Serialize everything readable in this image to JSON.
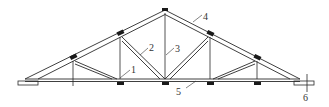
{
  "diagram": {
    "type": "roof-truss",
    "labels": [
      {
        "id": "1",
        "text": "1"
      },
      {
        "id": "2",
        "text": "2"
      },
      {
        "id": "3",
        "text": "3"
      },
      {
        "id": "4",
        "text": "4"
      },
      {
        "id": "5",
        "text": "5"
      },
      {
        "id": "6",
        "text": "6"
      }
    ],
    "colors": {
      "line": "#2a2a2a",
      "purlin": "#1a1a1a",
      "background": "#ffffff"
    }
  }
}
